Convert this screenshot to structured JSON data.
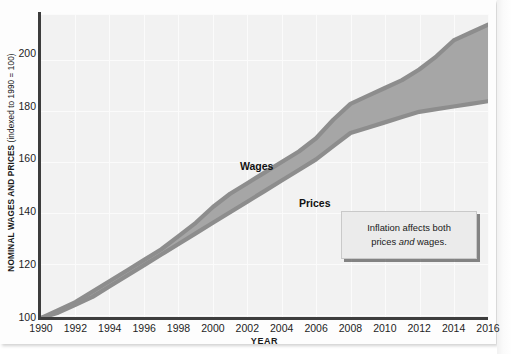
{
  "chart_data": {
    "type": "area",
    "title": "",
    "subtitle": "",
    "xlabel": "YEAR",
    "ylabel": "NOMINAL WAGES AND PRICES (indexed to 1990 = 100)",
    "ylabel_strong": "NOMINAL WAGES AND PRICES",
    "ylabel_light": " (indexed to 1990 = 100)",
    "xlim": [
      1990,
      2016
    ],
    "ylim": [
      100,
      215
    ],
    "grid": true,
    "legend": "inline-labels",
    "ytick_labels": [
      "100",
      "120",
      "140",
      "160",
      "180",
      "200"
    ],
    "yticks": [
      100,
      120,
      140,
      160,
      180,
      200
    ],
    "xtick_labels": [
      "1990",
      "1992",
      "1994",
      "1996",
      "1998",
      "2000",
      "2002",
      "2004",
      "2006",
      "2008",
      "2010",
      "2012",
      "2014",
      "2016"
    ],
    "xticks": [
      1990,
      1992,
      1994,
      1996,
      1998,
      2000,
      2002,
      2004,
      2006,
      2008,
      2010,
      2012,
      2014,
      2016
    ],
    "x": [
      1990,
      1991,
      1992,
      1993,
      1994,
      1995,
      1996,
      1997,
      1998,
      1999,
      2000,
      2001,
      2002,
      2003,
      2004,
      2005,
      2006,
      2007,
      2008,
      2009,
      2010,
      2011,
      2012,
      2013,
      2014,
      2015,
      2016
    ],
    "series": [
      {
        "name": "Wages",
        "color": "#8d8d8d",
        "values": [
          100,
          103,
          106,
          110,
          114,
          118,
          122,
          126,
          131,
          136,
          142,
          147,
          151,
          155,
          159,
          163,
          168,
          175,
          181,
          184,
          187,
          190,
          194,
          199,
          205,
          208,
          211
        ]
      },
      {
        "name": "Prices",
        "color": "#8d8d8d",
        "values": [
          100,
          102,
          105,
          108,
          112,
          116,
          120,
          124,
          128,
          132,
          136,
          140,
          144,
          148,
          152,
          156,
          160,
          165,
          170,
          172,
          174,
          176,
          178,
          179,
          180,
          181,
          182
        ]
      }
    ],
    "band": {
      "fill": "#a6a6a6",
      "upper_series": "Wages",
      "lower_series": "Prices"
    },
    "annotations": [
      {
        "name": "wages-label",
        "text": "Wages",
        "x": 2001,
        "y": 163
      },
      {
        "name": "prices-label",
        "text": "Prices",
        "x": 2004,
        "y": 141
      }
    ]
  },
  "callout": {
    "line1": "Inflation affects both",
    "line2_before": "prices ",
    "line2_em": "and",
    "line2_after": " wages."
  },
  "labels": {
    "wages": "Wages",
    "prices": "Prices"
  }
}
